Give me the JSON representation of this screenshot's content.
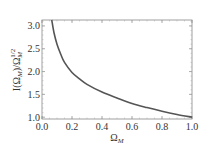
{
  "chart_data": {
    "type": "line",
    "title": "",
    "xlabel": "Ω_M",
    "ylabel": "I(Ω_M)/Ω_M^{1/2}",
    "xlim": [
      0.0,
      1.0
    ],
    "ylim": [
      0.96,
      3.13
    ],
    "grid": false,
    "legend": null,
    "x_ticks": [
      "0.0",
      "0.2",
      "0.4",
      "0.6",
      "0.8",
      "1.0"
    ],
    "y_ticks": [
      "1.0",
      "1.5",
      "2.0",
      "2.5",
      "3.0"
    ],
    "series": [
      {
        "name": "I(Ω_M)/Ω_M^{1/2}",
        "color": "#555555",
        "x": [
          0.065,
          0.08,
          0.1,
          0.125,
          0.15,
          0.2,
          0.25,
          0.3,
          0.4,
          0.5,
          0.6,
          0.7,
          0.8,
          0.9,
          1.0
        ],
        "y": [
          3.13,
          2.85,
          2.6,
          2.38,
          2.2,
          1.98,
          1.84,
          1.72,
          1.55,
          1.42,
          1.3,
          1.21,
          1.13,
          1.06,
          1.0
        ]
      }
    ]
  },
  "labels": {
    "x_axis": "Ω",
    "x_axis_sub": "M",
    "y_axis_main": "I(Ω",
    "y_axis_sub": "M",
    "y_axis_mid": ")/Ω",
    "y_axis_sub2": "M",
    "y_axis_sup": "1/2"
  }
}
